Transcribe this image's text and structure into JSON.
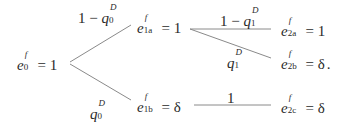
{
  "diagram": {
    "type": "probability-tree",
    "nodes": {
      "root": {
        "var": "e",
        "sup": "f",
        "sub": "0",
        "eq": "=",
        "value": "1"
      },
      "n1a": {
        "var": "e",
        "sup": "f",
        "sub": "1a",
        "eq": "=",
        "value": "1"
      },
      "n1b": {
        "var": "e",
        "sup": "f",
        "sub": "1b",
        "eq": "=",
        "value": "δ"
      },
      "n2a": {
        "var": "e",
        "sup": "f",
        "sub": "2a",
        "eq": "=",
        "value": "1"
      },
      "n2b": {
        "var": "e",
        "sup": "f",
        "sub": "2b",
        "eq": "=",
        "value": "δ",
        "suffix": "."
      },
      "n2c": {
        "var": "e",
        "sup": "f",
        "sub": "2c",
        "eq": "=",
        "value": "δ"
      }
    },
    "edges": [
      {
        "from": "root",
        "to": "n1a",
        "label": {
          "prefix": "1 − ",
          "var": "q",
          "sup": "D",
          "sub": "0"
        }
      },
      {
        "from": "root",
        "to": "n1b",
        "label": {
          "prefix": "",
          "var": "q",
          "sup": "D",
          "sub": "0"
        }
      },
      {
        "from": "n1a",
        "to": "n2a",
        "label": {
          "prefix": "1 − ",
          "var": "q",
          "sup": "D",
          "sub": "1"
        }
      },
      {
        "from": "n1a",
        "to": "n2b",
        "label": {
          "prefix": "",
          "var": "q",
          "sup": "D",
          "sub": "1"
        }
      },
      {
        "from": "n1b",
        "to": "n2c",
        "label": {
          "prefix": "1",
          "var": "",
          "sup": "",
          "sub": ""
        }
      }
    ]
  }
}
